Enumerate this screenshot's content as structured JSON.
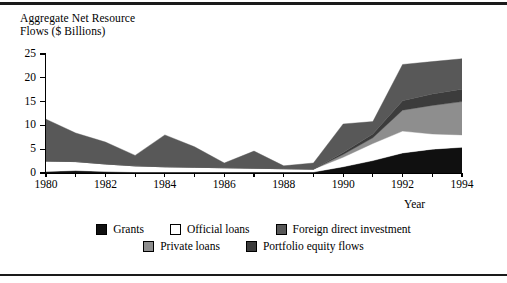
{
  "figure": {
    "axis_title": "Aggregate Net Resource\nFlows ($ Billions)",
    "xaxis_name": "Year"
  },
  "legend": {
    "rows": [
      [
        {
          "label": "Grants",
          "color": "#101010",
          "name": "legend-grants"
        },
        {
          "label": "Official loans",
          "color": "#ffffff",
          "name": "legend-official-loans"
        },
        {
          "label": "Foreign direct investment",
          "color": "#585858",
          "name": "legend-foreign-direct-investment"
        }
      ],
      [
        {
          "label": "Private loans",
          "color": "#8e8e8e",
          "name": "legend-private-loans"
        },
        {
          "label": "Portfolio equity flows",
          "color": "#3c3c3c",
          "name": "legend-portfolio-equity-flows"
        }
      ]
    ]
  },
  "chart_data": {
    "type": "area",
    "stacked": true,
    "title": "Aggregate Net Resource Flows ($ Billions)",
    "xlabel": "Year",
    "ylabel": "Aggregate Net Resource Flows ($ Billions)",
    "xlim": [
      1980,
      1994
    ],
    "ylim": [
      0,
      25
    ],
    "yticks": [
      0,
      5,
      10,
      15,
      20,
      25
    ],
    "xticks": [
      1980,
      1981,
      1982,
      1983,
      1984,
      1985,
      1986,
      1987,
      1988,
      1989,
      1990,
      1991,
      1992,
      1993,
      1994
    ],
    "xtick_labels": [
      "1980",
      "",
      "1982",
      "",
      "1984",
      "",
      "1986",
      "",
      "1988",
      "",
      "1990",
      "",
      "1992",
      "",
      "1994"
    ],
    "grid": false,
    "legend_position": "bottom",
    "x": [
      1980,
      1981,
      1982,
      1983,
      1984,
      1985,
      1986,
      1987,
      1988,
      1989,
      1990,
      1991,
      1992,
      1993,
      1994
    ],
    "series": [
      {
        "name": "Grants",
        "color": "#101010",
        "values": [
          0.3,
          0.5,
          0.3,
          0.2,
          0.2,
          0.2,
          0.2,
          0.2,
          0.2,
          0.2,
          1.3,
          2.6,
          4.2,
          5.0,
          5.4
        ]
      },
      {
        "name": "Official loans",
        "color": "#ffffff",
        "values": [
          2.2,
          1.9,
          1.6,
          1.3,
          1.1,
          1.0,
          0.9,
          0.8,
          0.7,
          0.6,
          2.0,
          3.6,
          4.6,
          3.2,
          2.6
        ]
      },
      {
        "name": "Private loans",
        "color": "#8e8e8e",
        "values": [
          0.0,
          0.0,
          0.0,
          0.0,
          0.0,
          0.0,
          0.0,
          0.0,
          0.0,
          0.0,
          0.6,
          1.2,
          4.4,
          6.0,
          7.0
        ]
      },
      {
        "name": "Portfolio equity flows",
        "color": "#3c3c3c",
        "values": [
          0.0,
          0.0,
          0.0,
          0.0,
          0.0,
          0.0,
          0.0,
          0.0,
          0.0,
          0.0,
          0.4,
          0.8,
          2.0,
          2.4,
          2.6
        ]
      },
      {
        "name": "Foreign direct investment",
        "color": "#585858",
        "values": [
          8.8,
          6.0,
          4.6,
          2.2,
          6.7,
          4.3,
          1.0,
          3.6,
          0.6,
          1.3,
          6.0,
          2.6,
          7.6,
          6.8,
          6.4
        ]
      }
    ],
    "totals": [
      11.3,
      8.4,
      6.5,
      3.7,
      8.0,
      5.5,
      2.1,
      4.6,
      1.5,
      2.1,
      10.3,
      10.8,
      22.8,
      23.4,
      24.0
    ]
  }
}
